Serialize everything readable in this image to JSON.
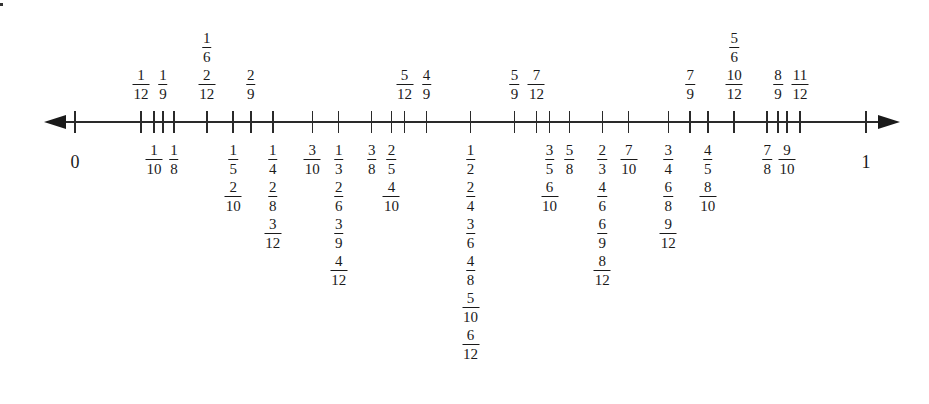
{
  "axis": {
    "y": 122,
    "x_start": 44,
    "x_end": 900,
    "zero_x": 75,
    "one_x": 866,
    "endpoints": [
      {
        "label": "0",
        "value": 0
      },
      {
        "label": "1",
        "value": 1
      }
    ]
  },
  "ticks": [
    {
      "value": 0
    },
    {
      "value": 0.08333
    },
    {
      "value": 0.1
    },
    {
      "value": 0.11111
    },
    {
      "value": 0.125
    },
    {
      "value": 0.16667
    },
    {
      "value": 0.2
    },
    {
      "value": 0.22222
    },
    {
      "value": 0.25
    },
    {
      "value": 0.3
    },
    {
      "value": 0.33333
    },
    {
      "value": 0.375
    },
    {
      "value": 0.4
    },
    {
      "value": 0.41667
    },
    {
      "value": 0.44444
    },
    {
      "value": 0.5
    },
    {
      "value": 0.55556
    },
    {
      "value": 0.58333
    },
    {
      "value": 0.6
    },
    {
      "value": 0.625
    },
    {
      "value": 0.66667
    },
    {
      "value": 0.7
    },
    {
      "value": 0.75
    },
    {
      "value": 0.77778
    },
    {
      "value": 0.8
    },
    {
      "value": 0.83333
    },
    {
      "value": 0.875
    },
    {
      "value": 0.88889
    },
    {
      "value": 0.9
    },
    {
      "value": 0.91667
    },
    {
      "value": 1
    }
  ],
  "above": [
    {
      "value": 0.08333,
      "fracs": [
        [
          "1",
          "12"
        ]
      ]
    },
    {
      "value": 0.11111,
      "fracs": [
        [
          "1",
          "9"
        ]
      ]
    },
    {
      "value": 0.16667,
      "fracs": [
        [
          "1",
          "6"
        ],
        [
          "2",
          "12"
        ]
      ]
    },
    {
      "value": 0.22222,
      "fracs": [
        [
          "2",
          "9"
        ]
      ]
    },
    {
      "value": 0.41667,
      "fracs": [
        [
          "5",
          "12"
        ]
      ]
    },
    {
      "value": 0.44444,
      "fracs": [
        [
          "4",
          "9"
        ]
      ]
    },
    {
      "value": 0.55556,
      "fracs": [
        [
          "5",
          "9"
        ]
      ]
    },
    {
      "value": 0.58333,
      "fracs": [
        [
          "7",
          "12"
        ]
      ]
    },
    {
      "value": 0.77778,
      "fracs": [
        [
          "7",
          "9"
        ]
      ]
    },
    {
      "value": 0.83333,
      "fracs": [
        [
          "5",
          "6"
        ],
        [
          "10",
          "12"
        ]
      ]
    },
    {
      "value": 0.88889,
      "fracs": [
        [
          "8",
          "9"
        ]
      ]
    },
    {
      "value": 0.91667,
      "fracs": [
        [
          "11",
          "12"
        ]
      ]
    }
  ],
  "below": [
    {
      "value": 0.1,
      "fracs": [
        [
          "1",
          "10"
        ]
      ]
    },
    {
      "value": 0.125,
      "fracs": [
        [
          "1",
          "8"
        ]
      ]
    },
    {
      "value": 0.2,
      "fracs": [
        [
          "1",
          "5"
        ],
        [
          "2",
          "10"
        ]
      ]
    },
    {
      "value": 0.25,
      "fracs": [
        [
          "1",
          "4"
        ],
        [
          "2",
          "8"
        ],
        [
          "3",
          "12"
        ]
      ]
    },
    {
      "value": 0.3,
      "fracs": [
        [
          "3",
          "10"
        ]
      ]
    },
    {
      "value": 0.33333,
      "fracs": [
        [
          "1",
          "3"
        ],
        [
          "2",
          "6"
        ],
        [
          "3",
          "9"
        ],
        [
          "4",
          "12"
        ]
      ]
    },
    {
      "value": 0.375,
      "fracs": [
        [
          "3",
          "8"
        ]
      ]
    },
    {
      "value": 0.4,
      "fracs": [
        [
          "2",
          "5"
        ],
        [
          "4",
          "10"
        ]
      ]
    },
    {
      "value": 0.5,
      "fracs": [
        [
          "1",
          "2"
        ],
        [
          "2",
          "4"
        ],
        [
          "3",
          "6"
        ],
        [
          "4",
          "8"
        ],
        [
          "5",
          "10"
        ],
        [
          "6",
          "12"
        ]
      ]
    },
    {
      "value": 0.6,
      "fracs": [
        [
          "3",
          "5"
        ],
        [
          "6",
          "10"
        ]
      ]
    },
    {
      "value": 0.625,
      "fracs": [
        [
          "5",
          "8"
        ]
      ]
    },
    {
      "value": 0.66667,
      "fracs": [
        [
          "2",
          "3"
        ],
        [
          "4",
          "6"
        ],
        [
          "6",
          "9"
        ],
        [
          "8",
          "12"
        ]
      ]
    },
    {
      "value": 0.7,
      "fracs": [
        [
          "7",
          "10"
        ]
      ]
    },
    {
      "value": 0.75,
      "fracs": [
        [
          "3",
          "4"
        ],
        [
          "6",
          "8"
        ],
        [
          "9",
          "12"
        ]
      ]
    },
    {
      "value": 0.8,
      "fracs": [
        [
          "4",
          "5"
        ],
        [
          "8",
          "10"
        ]
      ]
    },
    {
      "value": 0.875,
      "fracs": [
        [
          "7",
          "8"
        ]
      ]
    },
    {
      "value": 0.9,
      "fracs": [
        [
          "9",
          "10"
        ]
      ]
    }
  ]
}
